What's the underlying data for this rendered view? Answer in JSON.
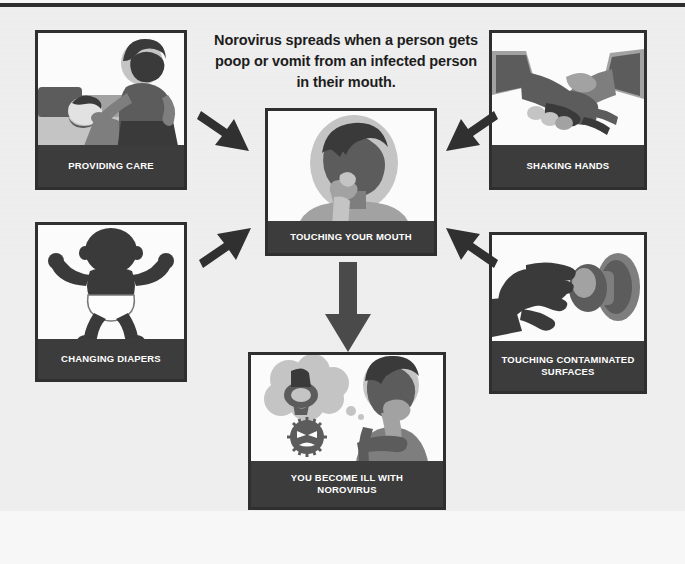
{
  "document": {
    "type": "public-health-infographic",
    "title_text": "Norovirus spreads when a person gets poop or vomit from an infected person in their mouth.",
    "background_color": "#efefef",
    "caption_bar_color": "#3c3c3c",
    "caption_text_color": "#ffffff",
    "border_color": "#2f2f2f"
  },
  "heading": {
    "line1": "Norovirus spreads when a person gets",
    "line2": "poop or vomit from an infected person",
    "line3": "in their mouth."
  },
  "panels": [
    {
      "id": "providing-care",
      "caption": "PROVIDING CARE",
      "position": "top-left",
      "art": "caregiver-standing-beside-person-in-bed"
    },
    {
      "id": "shaking-hands",
      "caption": "SHAKING HANDS",
      "position": "top-right",
      "art": "two-hands-clasped-handshake"
    },
    {
      "id": "changing-diapers",
      "caption": "CHANGING DIAPERS",
      "position": "middle-left",
      "art": "baby-silhouette-wearing-diaper"
    },
    {
      "id": "touching-contaminated-surfaces",
      "caption_line1": "TOUCHING CONTAMINATED",
      "caption_line2": "SURFACES",
      "position": "middle-right",
      "art": "hand-reaching-for-doorknob"
    },
    {
      "id": "touching-your-mouth",
      "caption": "TOUCHING YOUR MOUTH",
      "position": "center",
      "art": "head-silhouette-with-hand-at-mouth"
    },
    {
      "id": "you-become-ill",
      "caption_line1": "YOU BECOME ILL WITH",
      "caption_line2": "NOROVIRUS",
      "position": "bottom-center",
      "art": "sick-person-with-toilet-thought-bubble-and-virus"
    }
  ],
  "arrows": [
    {
      "id": "care-to-mouth",
      "direction": "down-right",
      "from": "providing-care",
      "to": "touching-your-mouth"
    },
    {
      "id": "shake-to-mouth",
      "direction": "down-left",
      "from": "shaking-hands",
      "to": "touching-your-mouth"
    },
    {
      "id": "diaper-to-mouth",
      "direction": "up-right",
      "from": "changing-diapers",
      "to": "touching-your-mouth"
    },
    {
      "id": "surface-to-mouth",
      "direction": "up-left",
      "from": "touching-contaminated-surfaces",
      "to": "touching-your-mouth"
    },
    {
      "id": "mouth-to-ill",
      "direction": "down",
      "from": "touching-your-mouth",
      "to": "you-become-ill"
    }
  ]
}
